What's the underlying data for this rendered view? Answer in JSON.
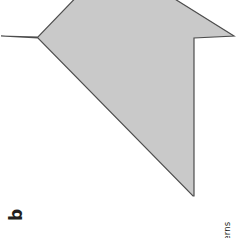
{
  "page": {
    "width": 244,
    "height": 238,
    "background": "#ffffff"
  },
  "part_label": {
    "text": "b",
    "color": "#231f20",
    "rotation_degrees": -90
  },
  "footer": {
    "unit_label": "Unit 5:",
    "unit_title": " Shapes and Patterns",
    "full_text": "Unit 5: Shapes and Patterns",
    "color": "#231f20",
    "rotation_degrees": -90
  },
  "figure": {
    "name": "arrow-polygon",
    "fill_color": "#c9c9c9",
    "stroke_color": "#4d4d4d",
    "stroke_width": 1.2,
    "points": "1,36 38,37 87,-14 154,-14 234,36 194,38 194,196 193,196 38,38",
    "vertices": [
      {
        "name": "left-tip",
        "x": 1,
        "y": 36
      },
      {
        "name": "left-inner-notch",
        "x": 38,
        "y": 37
      },
      {
        "name": "top-left-clip",
        "x": 87,
        "y": -14
      },
      {
        "name": "top-right-clip",
        "x": 154,
        "y": -14
      },
      {
        "name": "right-tip",
        "x": 234,
        "y": 36
      },
      {
        "name": "right-inner-notch",
        "x": 194,
        "y": 38
      },
      {
        "name": "bottom-vertex",
        "x": 193,
        "y": 196
      }
    ]
  }
}
